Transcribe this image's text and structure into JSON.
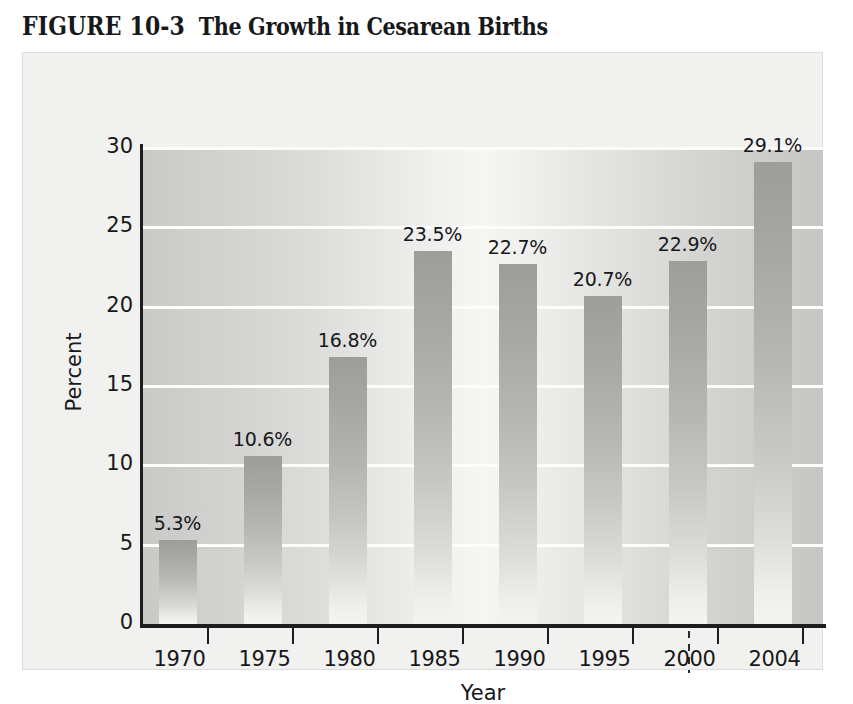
{
  "figure": {
    "number": "FIGURE 10-3",
    "name": "The Growth in Cesarean Births"
  },
  "chart_data": {
    "type": "bar",
    "title": "The Growth in Cesarean Births",
    "xlabel": "Year",
    "ylabel": "Percent",
    "categories": [
      "1970",
      "1975",
      "1980",
      "1985",
      "1990",
      "1995",
      "2000",
      "2004"
    ],
    "values": [
      5.3,
      10.6,
      16.8,
      23.5,
      22.7,
      20.7,
      22.9,
      29.1
    ],
    "data_labels": [
      "5.3%",
      "10.6%",
      "16.8%",
      "23.5%",
      "22.7%",
      "20.7%",
      "22.9%",
      "29.1%"
    ],
    "ylim": [
      0,
      30
    ],
    "yticks": [
      0,
      5,
      10,
      15,
      20,
      25,
      30
    ],
    "ytick_labels": [
      "0",
      "5",
      "10",
      "15",
      "20",
      "25",
      "30"
    ],
    "grid": true,
    "grid_axis": "y",
    "legend": null,
    "axis_break": {
      "between": [
        "2000",
        "2004"
      ],
      "style": "dashed-vertical"
    },
    "colors": {
      "bar_top": "#9d9d9b",
      "bar_bottom": "#f4f4f2",
      "plot_background": "#dcdcda",
      "gridline": "#fdfdfc",
      "axis": "#1d1d1f",
      "text": "#17181a",
      "figure_background": "#f1f1ef"
    }
  }
}
